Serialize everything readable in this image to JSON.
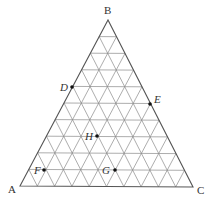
{
  "diagram": {
    "type": "ternary-grid",
    "divisions": 10,
    "vertices": [
      {
        "label": "A",
        "x": 20,
        "y": 186,
        "lx": 8,
        "ly": 193
      },
      {
        "label": "B",
        "x": 108,
        "y": 20,
        "lx": 104,
        "ly": 14
      },
      {
        "label": "C",
        "x": 193,
        "y": 187,
        "lx": 197,
        "ly": 194
      }
    ],
    "points": [
      {
        "label": "D",
        "x": 72,
        "y": 87,
        "lx": 60,
        "ly": 91
      },
      {
        "label": "E",
        "x": 150,
        "y": 104,
        "lx": 154,
        "ly": 103
      },
      {
        "label": "H",
        "x": 97,
        "y": 136,
        "lx": 85,
        "ly": 140
      },
      {
        "label": "F",
        "x": 44,
        "y": 170,
        "lx": 34,
        "ly": 174
      },
      {
        "label": "G",
        "x": 115,
        "y": 170,
        "lx": 102,
        "ly": 174
      }
    ]
  }
}
